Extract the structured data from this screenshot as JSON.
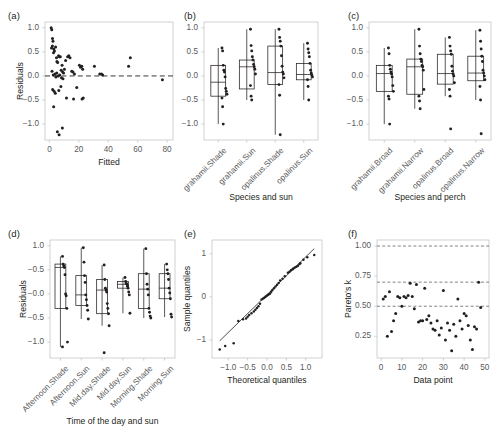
{
  "figure": {
    "panel_count": 6,
    "background": "#ffffff",
    "point_color": "#231f20",
    "frame_color": "#bcbec0"
  },
  "chart_data": [
    {
      "id": "a",
      "panel_label": "(a)",
      "type": "scatter",
      "title": "",
      "xlabel": "Fitted",
      "ylabel": "Residuals",
      "xlim": [
        -3,
        84
      ],
      "ylim": [
        -1.33,
        1.12
      ],
      "xticks": [
        0,
        20,
        40,
        60,
        80
      ],
      "yticks": [
        1.0,
        0.5,
        0.0,
        -0.5,
        -1.0
      ],
      "ytick_labels": [
        "1.0",
        "0.5",
        "0.0",
        "−0.5",
        "−1.0"
      ],
      "grid": false,
      "legend": "none",
      "annotations": [
        {
          "kind": "hline",
          "y": 0.0,
          "style": "dashed"
        }
      ],
      "x": [
        1.2,
        1.6,
        2.1,
        2.4,
        2.0,
        1.4,
        3.0,
        3.4,
        2.8,
        4.2,
        4.8,
        5.1,
        5.6,
        6.2,
        6.8,
        7.4,
        8.0,
        8.6,
        9.0,
        9.6,
        10.2,
        11.0,
        12.4,
        13.2,
        14.0,
        15.2,
        16.0,
        17.0,
        18.6,
        20.4,
        21.2,
        22.0,
        22.6,
        23.0,
        30.6,
        34.2,
        35.4,
        36.2,
        53.8,
        55.0,
        76.8,
        1.8,
        2.6,
        3.8,
        4.4,
        5.0,
        6.0,
        7.0,
        8.2,
        9.2,
        2.2,
        3.2,
        4.0,
        6.4,
        7.8,
        11.6,
        16.4,
        22.2,
        5.4,
        8.8,
        2.9,
        6.6
      ],
      "y": [
        1.0,
        0.96,
        0.78,
        0.72,
        0.62,
        0.58,
        0.56,
        0.52,
        0.48,
        0.6,
        0.38,
        0.3,
        0.28,
        0.42,
        0.4,
        0.4,
        0.12,
        0.22,
        0.08,
        0.06,
        0.14,
        0.32,
        0.4,
        0.42,
        0.38,
        0.1,
        0.08,
        0.04,
        -0.24,
        0.22,
        0.18,
        0.2,
        0.14,
        -0.46,
        0.2,
        0.04,
        0.04,
        0.02,
        0.2,
        0.38,
        -0.08,
        0.1,
        0.02,
        0.04,
        -0.02,
        0.06,
        0.0,
        0.02,
        -0.04,
        -0.06,
        -0.28,
        -0.32,
        -0.36,
        -0.3,
        -0.22,
        -0.46,
        -0.48,
        -0.48,
        -1.16,
        -1.08,
        -0.64,
        -1.22
      ]
    },
    {
      "id": "b",
      "panel_label": "(b)",
      "type": "boxplot",
      "title": "",
      "xlabel": "Species and sun",
      "ylabel": "",
      "ylim": [
        -1.33,
        1.12
      ],
      "yticks": [
        1.0,
        0.5,
        0.0,
        -0.5,
        -1.0
      ],
      "ytick_labels": [
        "1.0",
        "0.5",
        "0.0",
        "−0.5",
        "−1.0"
      ],
      "grid": false,
      "legend": "none",
      "categories": [
        "grahamii.Shade",
        "grahamii.Sun",
        "opalinus.Shade",
        "opalinus.Sun"
      ],
      "boxes": [
        {
          "category": "grahamii.Shade",
          "whisker_low": -1.0,
          "q1": -0.42,
          "median": -0.13,
          "q3": 0.22,
          "whisker_high": 0.58
        },
        {
          "category": "grahamii.Sun",
          "whisker_low": -0.5,
          "q1": -0.27,
          "median": 0.19,
          "q3": 0.33,
          "whisker_high": 0.97
        },
        {
          "category": "opalinus.Shade",
          "whisker_low": -1.22,
          "q1": -0.18,
          "median": 0.07,
          "q3": 0.62,
          "whisker_high": 0.97
        },
        {
          "category": "opalinus.Sun",
          "whisker_low": -0.5,
          "q1": -0.08,
          "median": 0.03,
          "q3": 0.26,
          "whisker_high": 0.68
        }
      ],
      "points": [
        {
          "category": "grahamii.Shade",
          "values": [
            0.58,
            0.52,
            0.22,
            0.12,
            0.08,
            -0.02,
            -0.26,
            -0.32,
            -0.38,
            -0.46,
            -0.64,
            -1.0
          ]
        },
        {
          "category": "grahamii.Sun",
          "values": [
            0.97,
            0.63,
            0.52,
            0.4,
            0.33,
            0.24,
            0.19,
            0.14,
            0.04,
            -0.2,
            -0.42,
            -0.5
          ]
        },
        {
          "category": "opalinus.Shade",
          "values": [
            0.97,
            0.8,
            0.72,
            0.62,
            0.42,
            0.2,
            0.08,
            0.04,
            -0.04,
            -0.18,
            -0.4,
            -1.22
          ]
        },
        {
          "category": "opalinus.Sun",
          "values": [
            0.68,
            0.56,
            0.48,
            0.4,
            0.26,
            0.12,
            0.06,
            0.02,
            -0.02,
            -0.08,
            -0.22,
            -0.5
          ]
        }
      ]
    },
    {
      "id": "c",
      "panel_label": "(c)",
      "type": "boxplot",
      "title": "",
      "xlabel": "Species and perch",
      "ylabel": "",
      "ylim": [
        -1.33,
        1.12
      ],
      "yticks": [
        1.0,
        0.5,
        0.0,
        -0.5,
        -1.0
      ],
      "ytick_labels": [
        "1.0",
        "0.5",
        "0.0",
        "−0.5",
        "−1.0"
      ],
      "grid": false,
      "legend": "none",
      "categories": [
        "grahamii.Broad",
        "grahamii.Narrow",
        "opalinus.Broad",
        "opalinus.Narrow"
      ],
      "boxes": [
        {
          "category": "grahamii.Broad",
          "whisker_low": -1.0,
          "q1": -0.32,
          "median": 0.05,
          "q3": 0.22,
          "whisker_high": 0.58
        },
        {
          "category": "grahamii.Narrow",
          "whisker_low": -0.68,
          "q1": -0.38,
          "median": 0.19,
          "q3": 0.35,
          "whisker_high": 0.97
        },
        {
          "category": "opalinus.Broad",
          "whisker_low": -0.42,
          "q1": -0.17,
          "median": 0.05,
          "q3": 0.45,
          "whisker_high": 0.8
        },
        {
          "category": "opalinus.Narrow",
          "whisker_low": -0.5,
          "q1": -0.1,
          "median": 0.06,
          "q3": 0.41,
          "whisker_high": 0.95
        }
      ],
      "points": [
        {
          "category": "grahamii.Broad",
          "values": [
            0.58,
            0.46,
            0.22,
            0.14,
            0.08,
            0.04,
            -0.02,
            -0.2,
            -0.32,
            -0.42,
            -0.48,
            -1.0
          ]
        },
        {
          "category": "grahamii.Narrow",
          "values": [
            0.97,
            0.62,
            0.46,
            0.35,
            0.3,
            0.22,
            0.19,
            0.12,
            -0.28,
            -0.42,
            -0.52,
            -0.68
          ]
        },
        {
          "category": "opalinus.Broad",
          "values": [
            0.8,
            0.62,
            0.52,
            0.45,
            0.2,
            0.1,
            0.04,
            0.0,
            -0.14,
            -0.28,
            -0.42,
            -1.1
          ]
        },
        {
          "category": "opalinus.Narrow",
          "values": [
            0.95,
            0.72,
            0.56,
            0.41,
            0.3,
            0.12,
            0.06,
            0.0,
            -0.08,
            -0.22,
            -0.5,
            -1.2
          ]
        }
      ]
    },
    {
      "id": "d",
      "panel_label": "(d)",
      "type": "boxplot",
      "title": "",
      "xlabel": "Time of the day and sun",
      "ylabel": "Residuals",
      "ylim": [
        -1.33,
        1.12
      ],
      "yticks": [
        1.0,
        0.5,
        0.0,
        -0.5,
        -1.0
      ],
      "ytick_labels": [
        "1.0",
        "−0.5",
        "−0.0",
        "−0.5",
        "−1.0"
      ],
      "grid": false,
      "legend": "none",
      "categories": [
        "Afternoon.Shade",
        "Afternoon.Sun",
        "Mid.day.Shade",
        "Mid.day.Sun",
        "Morning.Shade",
        "Morning.Sun"
      ],
      "boxes": [
        {
          "category": "Afternoon.Shade",
          "whisker_low": -1.1,
          "q1": -0.3,
          "median": 0.55,
          "q3": 0.62,
          "whisker_high": 0.78
        },
        {
          "category": "Afternoon.Sun",
          "whisker_low": -0.52,
          "q1": -0.24,
          "median": -0.02,
          "q3": 0.38,
          "whisker_high": 0.96
        },
        {
          "category": "Mid.day.Shade",
          "whisker_low": -0.66,
          "q1": -0.41,
          "median": 0.08,
          "q3": 0.3,
          "whisker_high": 0.6
        },
        {
          "category": "Mid.day.Sun",
          "whisker_low": -0.4,
          "q1": 0.12,
          "median": 0.2,
          "q3": 0.26,
          "whisker_high": 0.34
        },
        {
          "category": "Morning.Shade",
          "whisker_low": -0.5,
          "q1": -0.3,
          "median": 0.1,
          "q3": 0.42,
          "whisker_high": 0.94
        },
        {
          "category": "Morning.Sun",
          "whisker_low": -0.48,
          "q1": -0.1,
          "median": 0.12,
          "q3": 0.42,
          "whisker_high": 0.62
        }
      ],
      "points": [
        {
          "category": "Afternoon.Shade",
          "values": [
            0.78,
            0.62,
            0.58,
            0.55,
            0.4,
            0.0,
            -0.04,
            -0.3,
            -1.0,
            -1.1
          ]
        },
        {
          "category": "Afternoon.Sun",
          "values": [
            0.96,
            0.66,
            0.38,
            0.24,
            -0.02,
            -0.12,
            -0.24,
            -0.34,
            -0.52
          ]
        },
        {
          "category": "Mid.day.Shade",
          "values": [
            0.6,
            0.3,
            0.12,
            0.08,
            0.04,
            -0.2,
            -0.3,
            -0.41,
            -0.66,
            -1.22
          ]
        },
        {
          "category": "Mid.day.Sun",
          "values": [
            0.34,
            0.26,
            0.22,
            0.2,
            0.16,
            0.12,
            0.04,
            -0.02,
            -0.4
          ]
        },
        {
          "category": "Morning.Shade",
          "values": [
            0.94,
            0.42,
            0.2,
            0.1,
            -0.02,
            -0.3,
            -0.38,
            -0.46,
            -0.5
          ]
        },
        {
          "category": "Morning.Sun",
          "values": [
            0.62,
            0.5,
            0.42,
            0.3,
            0.12,
            0.02,
            -0.1,
            -0.42,
            -0.48
          ]
        }
      ]
    },
    {
      "id": "e",
      "panel_label": "(e)",
      "type": "scatter",
      "title": "",
      "xlabel": "Theoretical quantiles",
      "ylabel": "Sample quantiles",
      "xlim": [
        -1.42,
        1.42
      ],
      "ylim": [
        -1.42,
        1.32
      ],
      "xticks": [
        -1.0,
        -0.5,
        0.0,
        0.5,
        1.0
      ],
      "xtick_labels": [
        "−1.0",
        "−0.5",
        "0.0",
        "0.5",
        "1.0"
      ],
      "yticks": [
        -1,
        0,
        1
      ],
      "ytick_labels": [
        "−1",
        "0",
        "1"
      ],
      "grid": false,
      "legend": "none",
      "annotations": [
        {
          "kind": "qq-reference-line",
          "x1": -1.22,
          "y1": -1.02,
          "x2": 1.22,
          "y2": 1.12
        }
      ],
      "x": [
        -1.22,
        -1.08,
        -0.86,
        -0.62,
        -0.54,
        -0.46,
        -0.4,
        -0.34,
        -0.3,
        -0.26,
        -0.22,
        -0.18,
        -0.14,
        -0.1,
        -0.07,
        -0.04,
        -0.01,
        0.02,
        0.05,
        0.08,
        0.11,
        0.14,
        0.18,
        0.22,
        0.26,
        0.3,
        0.34,
        0.4,
        0.46,
        0.54,
        0.62,
        0.68,
        0.72,
        0.76,
        0.8,
        0.86,
        0.94,
        1.04,
        1.22,
        -0.74,
        -0.5,
        0.58,
        0.66,
        0.84
      ],
      "y": [
        -1.22,
        -1.14,
        -1.08,
        -0.52,
        -0.5,
        -0.42,
        -0.38,
        -0.34,
        -0.3,
        -0.26,
        -0.22,
        -0.16,
        -0.06,
        -0.04,
        -0.02,
        0.0,
        0.02,
        0.04,
        0.06,
        0.08,
        0.12,
        0.16,
        0.2,
        0.24,
        0.28,
        0.32,
        0.38,
        0.42,
        0.48,
        0.56,
        0.62,
        0.66,
        0.68,
        0.7,
        0.72,
        0.78,
        0.86,
        0.92,
        0.97,
        -0.56,
        -0.46,
        0.58,
        0.64,
        0.76
      ]
    },
    {
      "id": "f",
      "panel_label": "(f)",
      "type": "scatter",
      "title": "",
      "xlabel": "Data point",
      "ylabel": "Pareto's k",
      "xlim": [
        -2,
        52
      ],
      "ylim": [
        0.07,
        1.05
      ],
      "xticks": [
        0,
        10,
        20,
        30,
        40,
        50
      ],
      "yticks": [
        1.0,
        0.75,
        0.5,
        0.25
      ],
      "ytick_labels": [
        "1.00",
        "0.75",
        "0.50",
        "0.25"
      ],
      "grid": false,
      "legend": "none",
      "annotations": [
        {
          "kind": "hline",
          "y": 1.0,
          "style": "dashed"
        },
        {
          "kind": "hline",
          "y": 0.7,
          "style": "dashed"
        },
        {
          "kind": "hline",
          "y": 0.5,
          "style": "dashed"
        }
      ],
      "x": [
        1,
        2,
        3,
        4,
        5,
        6,
        7,
        8,
        9,
        10,
        11,
        12,
        13,
        14,
        15,
        16,
        17,
        18,
        19,
        20,
        21,
        22,
        23,
        24,
        25,
        26,
        27,
        28,
        29,
        30,
        31,
        32,
        33,
        34,
        35,
        36,
        37,
        38,
        39,
        40,
        41,
        42,
        43,
        44,
        45,
        46,
        47,
        48
      ],
      "y": [
        0.56,
        0.58,
        0.25,
        0.62,
        0.29,
        0.38,
        0.44,
        0.58,
        0.57,
        0.5,
        0.58,
        0.57,
        0.59,
        0.69,
        0.58,
        0.48,
        0.68,
        0.37,
        0.38,
        0.38,
        0.65,
        0.39,
        0.42,
        0.36,
        0.31,
        0.3,
        0.38,
        0.26,
        0.32,
        0.63,
        0.22,
        0.36,
        0.3,
        0.13,
        0.35,
        0.25,
        0.56,
        0.38,
        0.31,
        0.44,
        0.42,
        0.34,
        0.22,
        0.14,
        0.33,
        0.31,
        0.7,
        0.49
      ]
    }
  ]
}
